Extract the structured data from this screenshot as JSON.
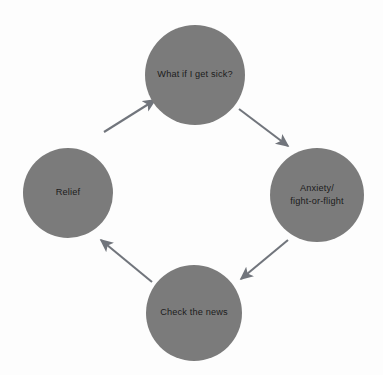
{
  "diagram": {
    "background_color": "#fdfdfd",
    "node_color": "#7b7b7b",
    "node_text_color": "#1c1c1c",
    "arrow_color": "#71757c",
    "direction": "clockwise",
    "nodes": [
      {
        "id": "what-if-i-get-sick",
        "label": "What if I get sick?",
        "lines": [
          "What if I get sick?"
        ],
        "cx": 195,
        "cy": 75,
        "r": 50,
        "position": "top"
      },
      {
        "id": "anxiety-fight-or-flight",
        "label": "Anxiety/ fight-or-flight",
        "lines": [
          "Anxiety/",
          "fight-or-flight"
        ],
        "cx": 317,
        "cy": 195,
        "r": 47,
        "position": "right"
      },
      {
        "id": "check-the-news",
        "label": "Check the news",
        "lines": [
          "Check the news"
        ],
        "cx": 194,
        "cy": 313,
        "r": 48,
        "position": "bottom"
      },
      {
        "id": "relief",
        "label": "Relief",
        "lines": [
          "Relief"
        ],
        "cx": 68,
        "cy": 193,
        "r": 45,
        "position": "left"
      }
    ],
    "edges": [
      {
        "id": "relief-to-what-if",
        "from": "relief",
        "to": "what-if-i-get-sick",
        "x1": 104,
        "y1": 132,
        "x2": 155,
        "y2": 100
      },
      {
        "id": "what-if-to-anxiety",
        "from": "what-if-i-get-sick",
        "to": "anxiety-fight-or-flight",
        "x1": 239,
        "y1": 109,
        "x2": 288,
        "y2": 146
      },
      {
        "id": "anxiety-to-check-the-news",
        "from": "anxiety-fight-or-flight",
        "to": "check-the-news",
        "x1": 288,
        "y1": 240,
        "x2": 241,
        "y2": 279
      },
      {
        "id": "check-the-news-to-relief",
        "from": "check-the-news",
        "to": "relief",
        "x1": 152,
        "y1": 282,
        "x2": 101,
        "y2": 240
      }
    ]
  }
}
